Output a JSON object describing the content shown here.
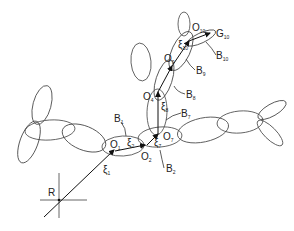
{
  "diagram": {
    "type": "rigid-body articulated chain (ellipsoid segments with local frames)",
    "origin_label": "R",
    "frames": [
      {
        "id": "O1",
        "label": "O",
        "sub": "1",
        "x": 116,
        "y": 144
      },
      {
        "id": "O2",
        "label": "O",
        "sub": "2",
        "x": 141,
        "y": 155
      },
      {
        "id": "O4",
        "label": "O",
        "sub": "4",
        "x": 149,
        "y": 96
      },
      {
        "id": "O7",
        "label": "O",
        "sub": "7",
        "x": 162,
        "y": 138
      },
      {
        "id": "O9",
        "label": "O",
        "sub": "9",
        "x": 169,
        "y": 58
      },
      {
        "id": "O10",
        "label": "O",
        "sub": "10",
        "x": 193,
        "y": 27
      },
      {
        "id": "G10",
        "label": "G",
        "sub": "10",
        "x": 216,
        "y": 34
      }
    ],
    "bodies": [
      {
        "id": "B1",
        "label": "B",
        "sub": "1",
        "x": 117,
        "y": 120
      },
      {
        "id": "B2",
        "label": "B",
        "sub": "2",
        "x": 166,
        "y": 170
      },
      {
        "id": "B7",
        "label": "B",
        "sub": "7",
        "x": 181,
        "y": 115
      },
      {
        "id": "B8",
        "label": "B",
        "sub": "8",
        "x": 186,
        "y": 96
      },
      {
        "id": "B9",
        "label": "B",
        "sub": "9",
        "x": 196,
        "y": 72
      },
      {
        "id": "B10",
        "label": "B",
        "sub": "10",
        "x": 217,
        "y": 57
      }
    ],
    "vectors": [
      {
        "id": "xi1",
        "label": "ξ",
        "sub": "1",
        "x": 103,
        "y": 172
      },
      {
        "id": "xi2",
        "label": "ξ",
        "sub": "2",
        "x": 128,
        "y": 146
      },
      {
        "id": "xi7",
        "label": "ξ",
        "sub": "7",
        "x": 154,
        "y": 144
      },
      {
        "id": "xi8",
        "label": "ξ",
        "sub": "8",
        "x": 161,
        "y": 110
      },
      {
        "id": "xi10",
        "label": "ξ",
        "sub": "10",
        "x": 179,
        "y": 48
      }
    ]
  }
}
